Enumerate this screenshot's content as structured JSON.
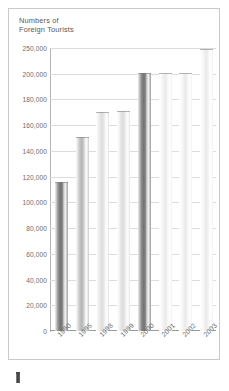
{
  "chart_data": {
    "type": "bar",
    "title": "Numbers of\nForeign Tourists",
    "xlabel": "",
    "ylabel": "",
    "categories": [
      "1990",
      "1995",
      "1998",
      "1999",
      "2000",
      "2001",
      "2002",
      "2003"
    ],
    "values": [
      116000,
      151000,
      170000,
      171000,
      201000,
      202000,
      202000,
      248000
    ],
    "series": [
      {
        "name": "Numbers of Foreign Tourists",
        "values": [
          116000,
          151000,
          170000,
          171000,
          201000,
          202000,
          202000,
          248000
        ]
      }
    ],
    "ytick_labels": [
      "0",
      "20,000",
      "40,000",
      "60,000",
      "80,000",
      "100,000",
      "120,000",
      "140,000",
      "160,000",
      "180,000",
      "200,000",
      "250,000"
    ],
    "ytick_values": [
      0,
      20000,
      40000,
      60000,
      80000,
      100000,
      120000,
      140000,
      160000,
      180000,
      200000,
      250000
    ],
    "ylim": [
      0,
      250000
    ],
    "axis_note": "broken axis: 200,000 to 250,000 compressed into one 20,000-sized interval",
    "grid": true,
    "legend": false,
    "bar_shading": [
      "dark",
      "mid",
      "light",
      "light",
      "dark",
      "pale",
      "pale",
      "pale"
    ],
    "colors": {
      "grid": "#dcdcdc",
      "axis": "#b4b4b4",
      "text": "#6c6c6e",
      "title_text": "#58585a",
      "frame": "#c9c9c9",
      "background": "#ffffff",
      "bar_dark": "#6f6f6f",
      "bar_mid": "#b4b4b4",
      "bar_light": "#dcdcdc",
      "bar_pale": "#eaeaea"
    }
  }
}
